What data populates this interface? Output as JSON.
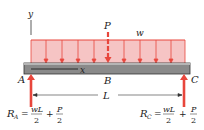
{
  "diagram": {
    "type": "simply-supported beam with distributed and point load",
    "labels": {
      "y_axis": "y",
      "x_axis": "x",
      "point_load": "P",
      "distributed_load": "w",
      "support_left": "A",
      "midpoint": "B",
      "support_right": "C",
      "span": "L"
    },
    "reactions": {
      "left": {
        "name": "R",
        "sub": "A",
        "eq": "=",
        "term1_num": "wL",
        "term1_den": "2",
        "plus": "+",
        "term2_num": "P",
        "term2_den": "2"
      },
      "right": {
        "name": "R",
        "sub": "C",
        "eq": "=",
        "term1_num": "wL",
        "term1_den": "2",
        "plus": "+",
        "term2_num": "P",
        "term2_den": "2"
      }
    },
    "colors": {
      "load_fill": "#f6c4c4",
      "load_stroke": "#e8463c",
      "beam_fill": "#8a8a8a",
      "beam_stroke": "#333333",
      "reaction_arrow": "#e8463c"
    }
  }
}
